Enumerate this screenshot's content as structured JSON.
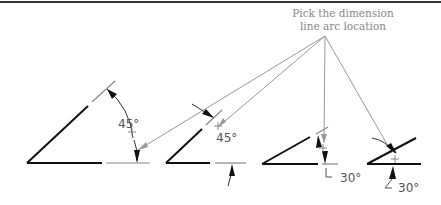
{
  "caption": {
    "line1": "Pick the dimension",
    "line2": "line arc location"
  },
  "figures": [
    {
      "id": 1,
      "angle_label": "45°",
      "description": "45 degree angle with arc dimension inside"
    },
    {
      "id": 2,
      "angle_label": "45°",
      "description": "45 degree angle with arrows outside"
    },
    {
      "id": 3,
      "angle_label": "30°",
      "description": "30 degree angle with arrows inside, leader text"
    },
    {
      "id": 4,
      "angle_label": "30°",
      "description": "30 degree angle with arrows outside, leader text"
    }
  ],
  "colors": {
    "line": "#111111",
    "extension": "#888888",
    "leader": "#999999",
    "text": "#555555",
    "border": "#333333"
  }
}
